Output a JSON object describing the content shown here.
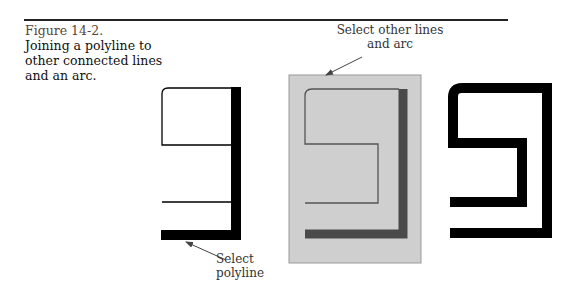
{
  "figure": {
    "number": "Figure 14-2.",
    "caption": "Joining a polyline to other connected lines and an arc."
  },
  "annotations": {
    "top_label": "Select other lines and arc",
    "bottom_label": "Select polyline"
  },
  "panels": [
    {
      "name": "before",
      "description": "Polyline (thick) plus thin lines and arc"
    },
    {
      "name": "selecting",
      "description": "Crossing window selecting other lines and arc",
      "highlight_color": "#cfcfcf"
    },
    {
      "name": "after",
      "description": "All segments joined into one wide polyline"
    }
  ],
  "colors": {
    "rule": "#222222",
    "figure_number": "#5a4634",
    "selection_box": "#cfcfcf",
    "selected_polyline": "#4a4a4a",
    "line": "#000000"
  }
}
